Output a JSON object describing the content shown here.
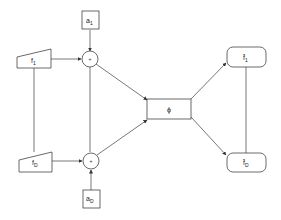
{
  "diagram": {
    "colors": {
      "stroke": "#444444",
      "fill": "#ffffff",
      "text": "#222222"
    },
    "nodes": {
      "a1": {
        "label": "a",
        "sub": "1",
        "shape": "square"
      },
      "aD": {
        "label": "a",
        "sub": "D",
        "shape": "square"
      },
      "f1": {
        "label": "f",
        "sub": "1",
        "shape": "trapezoid"
      },
      "fD": {
        "label": "f",
        "sub": "D",
        "shape": "trapezoid"
      },
      "sum1": {
        "label": "+",
        "shape": "circle"
      },
      "sumD": {
        "label": "+",
        "shape": "circle"
      },
      "phi": {
        "label": "ϕ",
        "shape": "rectangle"
      },
      "fhat1": {
        "label": "f̂",
        "sub": "1",
        "shape": "rounded-rectangle"
      },
      "fhatD": {
        "label": "f̂",
        "sub": "D",
        "shape": "rounded-rectangle"
      }
    },
    "edges": [
      {
        "from": "a1",
        "to": "sum1",
        "arrow": true
      },
      {
        "from": "f1",
        "to": "sum1",
        "arrow": true
      },
      {
        "from": "f1",
        "to": "fD",
        "arrow": false
      },
      {
        "from": "sum1",
        "to": "sumD",
        "arrow": false
      },
      {
        "from": "fD",
        "to": "sumD",
        "arrow": true
      },
      {
        "from": "aD",
        "to": "sumD",
        "arrow": true
      },
      {
        "from": "sum1",
        "to": "phi",
        "arrow": true
      },
      {
        "from": "sumD",
        "to": "phi",
        "arrow": true
      },
      {
        "from": "phi",
        "to": "fhat1",
        "arrow": true
      },
      {
        "from": "phi",
        "to": "fhatD",
        "arrow": true
      },
      {
        "from": "fhat1",
        "to": "fhatD",
        "arrow": false
      }
    ]
  }
}
